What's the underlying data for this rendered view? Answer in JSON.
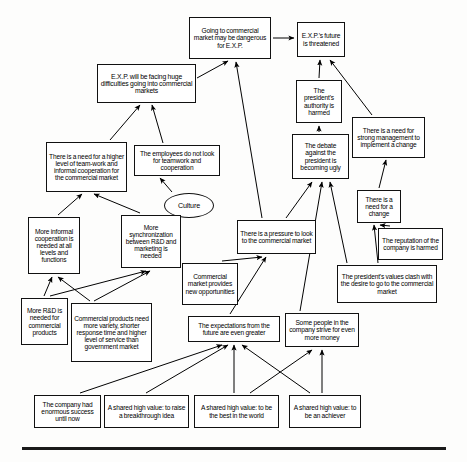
{
  "diagram": {
    "type": "causal-map",
    "background_color": "#fdfdfc",
    "node_fill": "#ffffff",
    "node_stroke": "#111111",
    "edge_color": "#000000",
    "bottom_rule": true,
    "nodes": [
      {
        "id": "going-commercial-dangerous",
        "label": "Going to commercial market may be dangerous for E.X.P.",
        "shape": "rect",
        "x": 189,
        "y": 17,
        "w": 82,
        "h": 42,
        "font": 6.6
      },
      {
        "id": "exp-future-threatened",
        "label": "E.X.P.'s future is threatened",
        "shape": "rect",
        "x": 297,
        "y": 22,
        "w": 48,
        "h": 35,
        "font": 6.6
      },
      {
        "id": "exp-facing-difficulties",
        "label": "E.X.P. will be facing huge difficulties going into commercial markets",
        "shape": "rect",
        "x": 97,
        "y": 64,
        "w": 99,
        "h": 39,
        "font": 6.8
      },
      {
        "id": "presidents-authority-harmed",
        "label": "The president's authority is harmed",
        "shape": "rect",
        "x": 296,
        "y": 80,
        "w": 46,
        "h": 43,
        "font": 6.6
      },
      {
        "id": "need-strong-management",
        "label": "There is a need for strong management to implement a change",
        "shape": "rect",
        "x": 352,
        "y": 117,
        "w": 73,
        "h": 41,
        "font": 6.6
      },
      {
        "id": "need-higher-teamwork",
        "label": "There is a need for a higher level of team-work and informal cooperation for the commercial market",
        "shape": "rect",
        "x": 46,
        "y": 142,
        "w": 81,
        "h": 50,
        "font": 6.6
      },
      {
        "id": "employees-no-teamwork",
        "label": "The employees do not look for teamwork and cooperation",
        "shape": "rect",
        "x": 134,
        "y": 145,
        "w": 86,
        "h": 31,
        "font": 6.6
      },
      {
        "id": "debate-becoming-ugly",
        "label": "The debate against the president is becoming ugly",
        "shape": "rect",
        "x": 292,
        "y": 134,
        "w": 57,
        "h": 45,
        "font": 6.6
      },
      {
        "id": "need-for-change",
        "label": "There is a need for a change",
        "shape": "rect",
        "x": 357,
        "y": 190,
        "w": 44,
        "h": 33,
        "font": 6.6
      },
      {
        "id": "culture",
        "label": "Culture",
        "shape": "ellipse",
        "x": 164,
        "y": 193,
        "w": 50,
        "h": 25,
        "font": 7.2
      },
      {
        "id": "pressure-commercial-market",
        "label": "There is a pressure to look to  the commercial market",
        "shape": "rect",
        "x": 237,
        "y": 220,
        "w": 79,
        "h": 34,
        "font": 6.6
      },
      {
        "id": "reputation-harmed",
        "label": "The reputation of the company is harmed",
        "shape": "rect",
        "x": 378,
        "y": 228,
        "w": 65,
        "h": 32,
        "font": 6.6
      },
      {
        "id": "more-informal-cooperation",
        "label": "More informal cooperation is needed at all levels and functions",
        "shape": "rect",
        "x": 28,
        "y": 217,
        "w": 52,
        "h": 57,
        "font": 6.6
      },
      {
        "id": "more-synchronization",
        "label": "More synchronization between R&D and marketing is needed",
        "shape": "rect",
        "x": 121,
        "y": 215,
        "w": 60,
        "h": 53,
        "font": 6.6
      },
      {
        "id": "commercial-market-opportunities",
        "label": "Commercial market provides new opportunities",
        "shape": "rect",
        "x": 182,
        "y": 263,
        "w": 56,
        "h": 42,
        "font": 6.6
      },
      {
        "id": "presidents-values-clash",
        "label": "The president's values clash with the desire to go to the commercial market",
        "shape": "rect",
        "x": 337,
        "y": 265,
        "w": 100,
        "h": 38,
        "font": 6.6
      },
      {
        "id": "more-rnd-needed",
        "label": "More R&D is needed for commercial products",
        "shape": "rect",
        "x": 21,
        "y": 298,
        "w": 47,
        "h": 47,
        "font": 6.6
      },
      {
        "id": "commercial-products-variety",
        "label": "Commercial products need more variety, shorter response time and higher level of service than government market",
        "shape": "rect",
        "x": 71,
        "y": 303,
        "w": 81,
        "h": 59,
        "font": 6.6
      },
      {
        "id": "expectations-greater",
        "label": "The expectations from the future are even greater",
        "shape": "rect",
        "x": 188,
        "y": 316,
        "w": 92,
        "h": 26,
        "font": 6.6
      },
      {
        "id": "some-people-strive-money",
        "label": "Some people in the company strive for even more money",
        "shape": "rect",
        "x": 285,
        "y": 313,
        "w": 74,
        "h": 34,
        "font": 6.6
      },
      {
        "id": "company-enormous-success",
        "label": "The company had enormous success until now",
        "shape": "rect",
        "x": 34,
        "y": 395,
        "w": 67,
        "h": 33,
        "font": 6.6
      },
      {
        "id": "value-breakthrough-idea",
        "label": "A shared high value: to raise a breakthrough idea",
        "shape": "rect",
        "x": 104,
        "y": 395,
        "w": 85,
        "h": 33,
        "font": 6.6
      },
      {
        "id": "value-best-in-world",
        "label": "A shared high value: to be the best in the world",
        "shape": "rect",
        "x": 194,
        "y": 395,
        "w": 85,
        "h": 33,
        "font": 6.6
      },
      {
        "id": "value-achiever",
        "label": "A shared high value: to be an achiever",
        "shape": "rect",
        "x": 289,
        "y": 395,
        "w": 72,
        "h": 33,
        "font": 6.6
      }
    ],
    "edges": [
      {
        "from": "going-commercial-dangerous",
        "to": "exp-future-threatened",
        "path": "M 273,38 L 294,38",
        "arrow": true
      },
      {
        "from": "exp-facing-difficulties",
        "to": "going-commercial-dangerous",
        "path": "M 197,78 L 228,61",
        "arrow": true
      },
      {
        "from": "need-higher-teamwork",
        "to": "exp-facing-difficulties",
        "path": "M 110,140 L 140,105",
        "arrow": true
      },
      {
        "from": "employees-no-teamwork",
        "to": "exp-facing-difficulties",
        "path": "M 163,143 L 152,105",
        "arrow": true
      },
      {
        "from": "culture",
        "to": "employees-no-teamwork",
        "path": "M 172,192 L 160,178",
        "arrow": true
      },
      {
        "from": "more-informal-cooperation",
        "to": "need-higher-teamwork",
        "path": "M 58,215 L 82,194",
        "arrow": true
      },
      {
        "from": "more-synchronization",
        "to": "need-higher-teamwork",
        "path": "M 140,213 L 94,194",
        "arrow": true
      },
      {
        "from": "more-rnd-needed",
        "to": "more-informal-cooperation",
        "path": "M 44,296 L 52,277",
        "arrow": true
      },
      {
        "from": "commercial-products-variety",
        "to": "more-informal-cooperation",
        "path": "M 90,301 L 58,277",
        "arrow": true
      },
      {
        "from": "more-rnd-needed",
        "to": "more-synchronization",
        "path": "M 50,296 L 146,271",
        "arrow": true
      },
      {
        "from": "commercial-products-variety",
        "to": "more-synchronization",
        "path": "M 94,301 L 150,271",
        "arrow": true
      },
      {
        "from": "pressure-commercial-market",
        "to": "going-commercial-dangerous",
        "path": "M 262,218 L 236,62",
        "arrow": true
      },
      {
        "from": "pressure-commercial-market",
        "to": "debate-becoming-ugly",
        "path": "M 286,218 L 312,182",
        "arrow": true
      },
      {
        "from": "debate-becoming-ugly",
        "to": "presidents-authority-harmed",
        "path": "M 319,132 L 319,126",
        "arrow": true
      },
      {
        "from": "presidents-authority-harmed",
        "to": "exp-future-threatened",
        "path": "M 319,78 L 320,60",
        "arrow": true
      },
      {
        "from": "need-strong-management",
        "to": "exp-future-threatened",
        "path": "M 372,115 L 330,60",
        "arrow": true
      },
      {
        "from": "need-for-change",
        "to": "need-strong-management",
        "path": "M 379,188 L 386,160",
        "arrow": true
      },
      {
        "from": "reputation-harmed",
        "to": "need-for-change",
        "path": "M 390,226 L 380,225",
        "arrow": true
      },
      {
        "from": "presidents-values-clash",
        "to": "need-for-change",
        "path": "M 378,263 L 374,225",
        "arrow": true
      },
      {
        "from": "presidents-values-clash",
        "to": "debate-becoming-ugly",
        "path": "M 347,263 L 330,182",
        "arrow": true
      },
      {
        "from": "commercial-market-opportunities",
        "to": "pressure-commercial-market",
        "path": "M 222,261 L 262,257",
        "arrow": true
      },
      {
        "from": "expectations-greater",
        "to": "pressure-commercial-market",
        "path": "M 230,314 L 266,257",
        "arrow": true
      },
      {
        "from": "some-people-strive-money",
        "to": "debate-becoming-ugly",
        "path": "M 300,311 L 322,182",
        "arrow": true
      },
      {
        "from": "company-enormous-success",
        "to": "expectations-greater",
        "path": "M 80,393 L 222,345",
        "arrow": true
      },
      {
        "from": "value-breakthrough-idea",
        "to": "expectations-greater",
        "path": "M 146,393 L 228,345",
        "arrow": true
      },
      {
        "from": "value-best-in-world",
        "to": "expectations-greater",
        "path": "M 234,393 L 234,345",
        "arrow": true
      },
      {
        "from": "value-achiever",
        "to": "expectations-greater",
        "path": "M 310,393 L 242,345",
        "arrow": true
      },
      {
        "from": "value-achiever",
        "to": "some-people-strive-money",
        "path": "M 322,393 L 322,350",
        "arrow": true
      },
      {
        "from": "value-best-in-world",
        "to": "some-people-strive-money",
        "path": "M 250,393 L 312,350",
        "arrow": true
      }
    ]
  }
}
